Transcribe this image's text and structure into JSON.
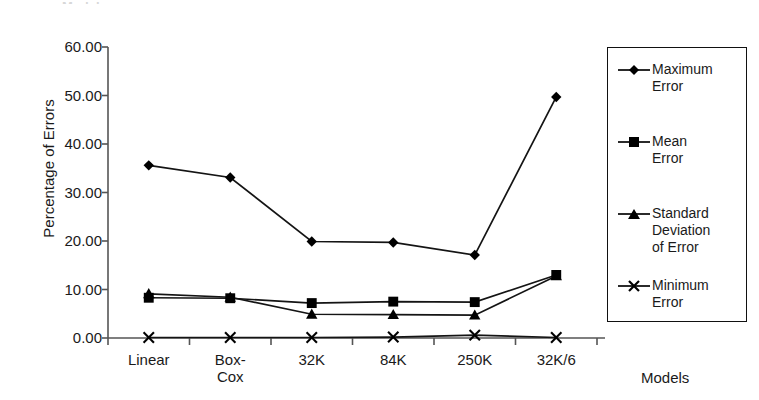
{
  "title_fragment": "Models",
  "axes": {
    "ylabel": "Percentage of Errors",
    "xlabel": "Models",
    "yticks": [
      "60.00",
      "50.00",
      "40.00",
      "30.00",
      "20.00",
      "10.00",
      "0.00"
    ],
    "xticks": [
      "Linear",
      "Box-\nCox",
      "32K",
      "84K",
      "250K",
      "32K/6"
    ]
  },
  "legend": {
    "items": [
      {
        "label": "Maximum\nError",
        "marker": "diamond",
        "name": "maximum-error"
      },
      {
        "label": "Mean\nError",
        "marker": "square",
        "name": "mean-error"
      },
      {
        "label": "Standard\nDeviation\nof Error",
        "marker": "triangle",
        "name": "standard-deviation-of-error"
      },
      {
        "label": "Minimum\nError",
        "marker": "cross",
        "name": "minimum-error"
      }
    ]
  },
  "colors": {
    "line": "#141414",
    "marker": "#000000",
    "axis": "#555555",
    "background": "#ffffff"
  },
  "chart_data": {
    "type": "line",
    "title": "",
    "xlabel": "Models",
    "ylabel": "Percentage of Errors",
    "categories": [
      "Linear",
      "Box-Cox",
      "32K",
      "84K",
      "250K",
      "32K/6"
    ],
    "ylim": [
      0,
      60
    ],
    "ytick_values": [
      0,
      10,
      20,
      30,
      40,
      50,
      60
    ],
    "grid": false,
    "legend_position": "right",
    "series": [
      {
        "name": "Maximum Error",
        "marker": "diamond",
        "values": [
          35.6,
          33.1,
          19.9,
          19.7,
          17.1,
          49.7
        ]
      },
      {
        "name": "Mean Error",
        "marker": "square",
        "values": [
          8.3,
          8.2,
          7.2,
          7.5,
          7.4,
          13.0
        ]
      },
      {
        "name": "Standard Deviation of Error",
        "marker": "triangle",
        "values": [
          9.1,
          8.4,
          4.9,
          4.8,
          4.7,
          12.8
        ]
      },
      {
        "name": "Minimum Error",
        "marker": "cross",
        "values": [
          0.1,
          0.1,
          0.1,
          0.2,
          0.6,
          0.1
        ]
      }
    ]
  }
}
